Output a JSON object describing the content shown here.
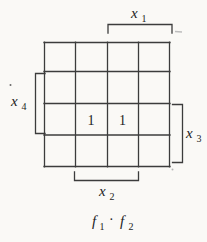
{
  "figure": {
    "type": "karnaugh-map-diagram",
    "colors": {
      "background": "#faf9f6",
      "line": "#3c3c3c",
      "text": "#232323",
      "artifact": "#bdbdbd"
    },
    "grid": {
      "rows": 4,
      "cols": 4
    },
    "variables": {
      "x1": {
        "base": "x",
        "sub": "1",
        "covers": "top bracket over columns 3-4"
      },
      "x2": {
        "base": "x",
        "sub": "2",
        "covers": "bottom bracket under columns 2-3"
      },
      "x3": {
        "base": "x",
        "sub": "3",
        "covers": "right bracket beside rows 3-4"
      },
      "x4": {
        "base": "x",
        "sub": "4",
        "covers": "left bracket beside rows 2-3"
      }
    },
    "cells": [
      {
        "row": 3,
        "col": 2,
        "value": "1"
      },
      {
        "row": 3,
        "col": 3,
        "value": "1"
      }
    ],
    "caption": {
      "term1_base": "f",
      "term1_sub": "1",
      "operator": "·",
      "term2_base": "f",
      "term2_sub": "2"
    }
  }
}
